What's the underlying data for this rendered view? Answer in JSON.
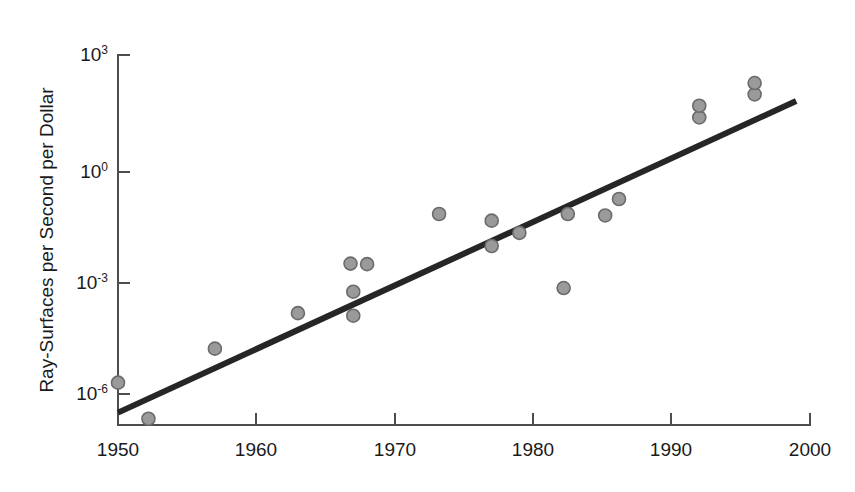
{
  "chart_data": {
    "type": "scatter",
    "title": "",
    "subtitle": "",
    "xlabel": "",
    "ylabel": "Ray-Surfaces per Second per Dollar",
    "yscale": "log",
    "xscale": "linear",
    "xlim": [
      1950,
      2000
    ],
    "ylim": [
      1e-07,
      1000
    ],
    "grid": false,
    "legend": null,
    "xticks": [
      1950,
      1960,
      1970,
      1980,
      1990,
      2000
    ],
    "xtick_labels": [
      "1950",
      "1960",
      "1970",
      "1980",
      "1990",
      "2000"
    ],
    "yticks": [
      1e-06,
      0.001,
      1,
      1000
    ],
    "ytick_labels": [
      "10-6",
      "10-3",
      "100",
      "103"
    ],
    "ytick_mantissa": [
      "10",
      "10",
      "10",
      "10"
    ],
    "ytick_exponent": [
      "-6",
      "-3",
      "0",
      "3"
    ],
    "series": [
      {
        "name": "Ray-surfaces per second per dollar",
        "marker": "circle",
        "color": "#9a9a9a",
        "edge_color": "#6b6b6b",
        "points": [
          {
            "x": 1950.0,
            "y": 2e-06
          },
          {
            "x": 1952.2,
            "y": 2.2e-07
          },
          {
            "x": 1957.0,
            "y": 1.6e-05
          },
          {
            "x": 1963.0,
            "y": 0.00014
          },
          {
            "x": 1966.8,
            "y": 0.0029
          },
          {
            "x": 1968.0,
            "y": 0.0028
          },
          {
            "x": 1967.0,
            "y": 0.00052
          },
          {
            "x": 1967.0,
            "y": 0.00012
          },
          {
            "x": 1973.2,
            "y": 0.06
          },
          {
            "x": 1977.0,
            "y": 0.04
          },
          {
            "x": 1977.0,
            "y": 0.0085
          },
          {
            "x": 1979.0,
            "y": 0.019
          },
          {
            "x": 1982.2,
            "y": 0.00065
          },
          {
            "x": 1982.5,
            "y": 0.06
          },
          {
            "x": 1985.2,
            "y": 0.055
          },
          {
            "x": 1986.2,
            "y": 0.15
          },
          {
            "x": 1992.0,
            "y": 22.0
          },
          {
            "x": 1992.0,
            "y": 45.0
          },
          {
            "x": 1996.0,
            "y": 90.0
          },
          {
            "x": 1996.0,
            "y": 180.0
          }
        ]
      }
    ],
    "trend_line": {
      "name": "fit",
      "color": "#262626",
      "x_start": 1950,
      "y_start": 3.2e-07,
      "x_end": 1999.0,
      "y_end": 60.0
    }
  }
}
